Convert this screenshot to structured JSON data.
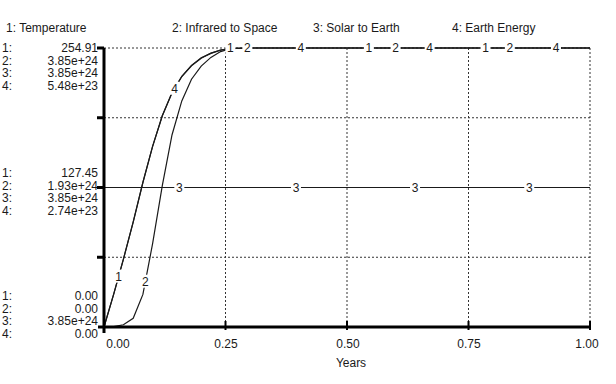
{
  "chart_data": {
    "type": "line",
    "title": "",
    "xlabel": "Years",
    "ylabel": "",
    "xlim": [
      0,
      1
    ],
    "x_ticks": [
      "0.00",
      "0.25",
      "0.50",
      "0.75",
      "1.00"
    ],
    "grid": true,
    "legend_position": "top",
    "legend": [
      "1: Temperature",
      "2: Infrared to Space",
      "3: Solar to Earth",
      "4: Earth Energy"
    ],
    "scales": {
      "top": [
        {
          "id": "1:",
          "value": "254.91"
        },
        {
          "id": "2:",
          "value": "3.85e+24"
        },
        {
          "id": "3:",
          "value": "3.85e+24"
        },
        {
          "id": "4:",
          "value": "5.48e+23"
        }
      ],
      "middle": [
        {
          "id": "1:",
          "value": "127.45"
        },
        {
          "id": "2:",
          "value": "1.93e+24"
        },
        {
          "id": "3:",
          "value": "3.85e+24"
        },
        {
          "id": "4:",
          "value": "2.74e+23"
        }
      ],
      "bottom": [
        {
          "id": "1:",
          "value": "0.00"
        },
        {
          "id": "2:",
          "value": "0.00"
        },
        {
          "id": "3:",
          "value": "3.85e+24"
        },
        {
          "id": "4:",
          "value": "0.00"
        }
      ]
    },
    "series": [
      {
        "name": "Temperature",
        "marker": "1",
        "ylim": [
          0,
          254.91
        ],
        "x": [
          0.0,
          0.02,
          0.04,
          0.06,
          0.08,
          0.1,
          0.12,
          0.14,
          0.16,
          0.18,
          0.2,
          0.22,
          0.24,
          0.26,
          0.3,
          0.5,
          0.75,
          1.0
        ],
        "values": [
          0,
          30,
          62,
          96,
          132,
          165,
          193,
          214,
          229,
          239,
          246,
          250,
          253,
          254.5,
          254.91,
          254.91,
          254.91,
          254.91
        ]
      },
      {
        "name": "Infrared to Space",
        "marker": "2",
        "ylim": [
          0,
          3.85e+24
        ],
        "x": [
          0.0,
          0.02,
          0.04,
          0.06,
          0.08,
          0.1,
          0.12,
          0.14,
          0.16,
          0.18,
          0.2,
          0.22,
          0.24,
          0.26,
          0.3,
          0.5,
          0.75,
          1.0
        ],
        "values": [
          0,
          5e+21,
          3e+22,
          1.2e+23,
          4.5e+23,
          1.15e+24,
          1.95e+24,
          2.65e+24,
          3.12e+24,
          3.42e+24,
          3.6e+24,
          3.72e+24,
          3.8e+24,
          3.84e+24,
          3.85e+24,
          3.85e+24,
          3.85e+24,
          3.85e+24
        ]
      },
      {
        "name": "Solar to Earth",
        "marker": "3",
        "ylim": [
          0,
          7.7e+24
        ],
        "x": [
          0.0,
          0.25,
          0.5,
          0.75,
          1.0
        ],
        "values": [
          3.85e+24,
          3.85e+24,
          3.85e+24,
          3.85e+24,
          3.85e+24
        ]
      },
      {
        "name": "Earth Energy",
        "marker": "4",
        "ylim": [
          0,
          5.48e+23
        ],
        "x": [
          0.0,
          0.02,
          0.04,
          0.06,
          0.08,
          0.1,
          0.12,
          0.14,
          0.16,
          0.18,
          0.2,
          0.22,
          0.24,
          0.26,
          0.3,
          0.5,
          0.75,
          1.0
        ],
        "values": [
          0,
          6.45e+22,
          1.33e+23,
          2.06e+23,
          2.84e+23,
          3.55e+23,
          4.15e+23,
          4.6e+23,
          4.92e+23,
          5.13e+23,
          5.28e+23,
          5.38e+23,
          5.44e+23,
          5.47e+23,
          5.48e+23,
          5.48e+23,
          5.48e+23,
          5.48e+23
        ]
      }
    ],
    "marker_positions": {
      "1": [
        0.03,
        0.26,
        0.545,
        0.785
      ],
      "2": [
        0.085,
        0.295,
        0.6,
        0.835
      ],
      "3": [
        0.155,
        0.395,
        0.64,
        0.875
      ],
      "4": [
        0.145,
        0.405,
        0.67,
        0.93
      ]
    }
  }
}
